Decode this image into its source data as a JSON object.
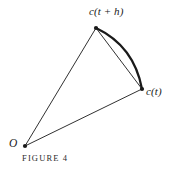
{
  "figure": {
    "caption": "FIGURE 4",
    "background_color": "#ffffff",
    "ink_color": "#1a1a1a",
    "labels": {
      "top_point": "c(t + h)",
      "right_point": "c(t)",
      "origin": "O"
    },
    "points": [
      {
        "name": "origin",
        "label": "O",
        "x": 25,
        "y": 146
      },
      {
        "name": "c-of-t-plus-h",
        "label": "c(t + h)",
        "x": 96,
        "y": 28
      },
      {
        "name": "c-of-t",
        "label": "c(t)",
        "x": 142,
        "y": 89
      }
    ],
    "segments": [
      {
        "name": "vector-o-to-cth",
        "from": "origin",
        "to": "c-of-t-plus-h",
        "style": "thin-straight",
        "stroke_width": 0.9
      },
      {
        "name": "vector-o-to-ct",
        "from": "origin",
        "to": "c-of-t",
        "style": "thin-straight",
        "stroke_width": 0.9
      },
      {
        "name": "chord-cth-to-ct",
        "from": "c-of-t-plus-h",
        "to": "c-of-t",
        "style": "thin-straight",
        "stroke_width": 0.9
      }
    ],
    "arc": {
      "name": "curve-arc-cth-to-ct",
      "from": "c-of-t-plus-h",
      "to": "c-of-t",
      "control_x": 134,
      "control_y": 46,
      "style": "thick-curved",
      "stroke_width": 2.3
    },
    "dot_radius": 2.1
  }
}
